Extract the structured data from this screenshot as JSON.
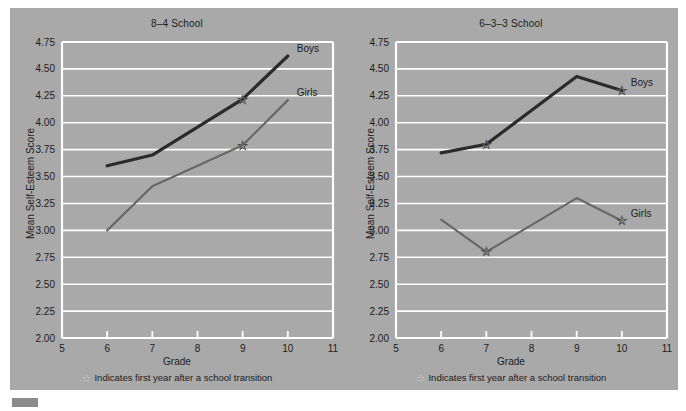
{
  "figure": {
    "background_color": "#a9a9a9",
    "gridline_color": "#ffffff",
    "boys_color": "#2b2b2b",
    "girls_color": "#686868",
    "footnote": "Indicates first year after a school transition",
    "star_icon": "☆"
  },
  "chart_data": [
    {
      "type": "line",
      "title": "8–4 School",
      "xlabel": "Grade",
      "ylabel": "Mean Self-Esteem Score",
      "xlim": [
        5,
        11
      ],
      "ylim": [
        2.0,
        4.75
      ],
      "xticks": [
        "5",
        "6",
        "7",
        "8",
        "9",
        "10",
        "11"
      ],
      "yticks": [
        "2.00",
        "2.25",
        "2.50",
        "2.75",
        "3.00",
        "3.25",
        "3.50",
        "3.75",
        "4.00",
        "4.25",
        "4.50",
        "4.75"
      ],
      "grid": true,
      "legend_position": "inline-right",
      "series": [
        {
          "name": "Boys",
          "color": "#2b2b2b",
          "x": [
            6,
            7,
            9,
            10
          ],
          "values": [
            3.6,
            3.7,
            4.22,
            4.62
          ],
          "transition_points": [
            9
          ]
        },
        {
          "name": "Girls",
          "color": "#686868",
          "x": [
            6,
            7,
            9,
            10
          ],
          "values": [
            3.0,
            3.41,
            3.79,
            4.21
          ],
          "transition_points": [
            9
          ]
        }
      ],
      "footnote": "Indicates first year after a school transition"
    },
    {
      "type": "line",
      "title": "6–3–3 School",
      "xlabel": "Grade",
      "ylabel": "Mean Self-Esteem Score",
      "xlim": [
        5,
        11
      ],
      "ylim": [
        2.0,
        4.75
      ],
      "xticks": [
        "5",
        "6",
        "7",
        "8",
        "9",
        "10",
        "11"
      ],
      "yticks": [
        "2.00",
        "2.25",
        "2.50",
        "2.75",
        "3.00",
        "3.25",
        "3.50",
        "3.75",
        "4.00",
        "4.25",
        "4.50",
        "4.75"
      ],
      "grid": true,
      "legend_position": "inline-right",
      "series": [
        {
          "name": "Boys",
          "color": "#2b2b2b",
          "x": [
            6,
            7,
            9,
            10
          ],
          "values": [
            3.72,
            3.8,
            4.43,
            4.3
          ],
          "transition_points": [
            7,
            10
          ]
        },
        {
          "name": "Girls",
          "color": "#686868",
          "x": [
            6,
            7,
            9,
            10
          ],
          "values": [
            3.1,
            2.8,
            3.3,
            3.09
          ],
          "transition_points": [
            7,
            10
          ]
        }
      ],
      "footnote": "Indicates first year after a school transition"
    }
  ]
}
